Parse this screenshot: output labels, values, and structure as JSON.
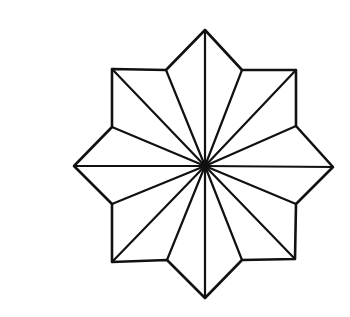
{
  "figure": {
    "stroke_color": "#111111",
    "background_color": "#ffffff",
    "outline_width": 2.6,
    "spoke_width": 2.2,
    "center": [
      205,
      166
    ],
    "vertices": [
      [
        205,
        30
      ],
      [
        242,
        70
      ],
      [
        296,
        70
      ],
      [
        296,
        126
      ],
      [
        333,
        167
      ],
      [
        296,
        204
      ],
      [
        295,
        259
      ],
      [
        242,
        260
      ],
      [
        205,
        298
      ],
      [
        167,
        260
      ],
      [
        112,
        262
      ],
      [
        112,
        204
      ],
      [
        74,
        166
      ],
      [
        112,
        127
      ],
      [
        112,
        69
      ],
      [
        166,
        70
      ]
    ]
  }
}
